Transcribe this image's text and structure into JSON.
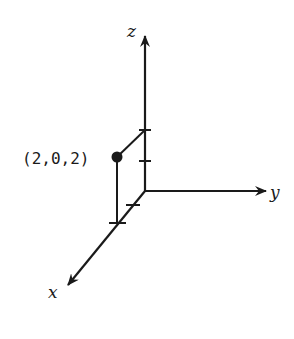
{
  "diagram": {
    "type": "3d-coordinate-axes",
    "axes": {
      "x": {
        "label": "x"
      },
      "y": {
        "label": "y"
      },
      "z": {
        "label": "z"
      }
    },
    "point": {
      "label": "(2,0,2)",
      "coordinates": [
        2,
        0,
        2
      ]
    },
    "ticks": {
      "x": [
        1,
        2
      ],
      "z": [
        1,
        2
      ]
    },
    "colors": {
      "stroke": "#1a1a1a",
      "background": "#ffffff"
    }
  }
}
